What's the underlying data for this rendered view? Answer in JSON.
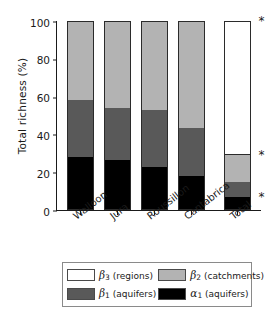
{
  "chart_data": {
    "type": "bar",
    "subtype": "stacked-bar-percent",
    "title": "",
    "xlabel": "",
    "ylabel": "Total richness (%)",
    "ylim": [
      0,
      100
    ],
    "yticks": [
      0,
      20,
      40,
      60,
      80,
      100
    ],
    "ytick_labels": [
      "0",
      "20",
      "40",
      "60",
      "80",
      "100"
    ],
    "grid": false,
    "legend_position": "bottom",
    "categories": [
      "Walloon",
      "Jura",
      "Roussillon",
      "Cantabrica",
      "Total"
    ],
    "series": [
      {
        "name": "alpha_1 (aquifers)",
        "key": "a1",
        "color": "#000000",
        "values": [
          28,
          26.5,
          23,
          18,
          7
        ]
      },
      {
        "name": "beta_1 (aquifers)",
        "key": "b1",
        "color": "#595959",
        "values": [
          30,
          27.5,
          30,
          25.5,
          8
        ]
      },
      {
        "name": "beta_2 (catchments)",
        "key": "b2",
        "color": "#b3b3b3",
        "values": [
          42,
          46,
          47,
          56.5,
          14
        ]
      },
      {
        "name": "beta_3 (regions)",
        "key": "b3",
        "color": "#ffffff",
        "values": [
          0,
          0,
          0,
          0,
          71
        ]
      }
    ],
    "cumulative_tops": {
      "Walloon": [
        28,
        58,
        100,
        100
      ],
      "Jura": [
        26.5,
        54,
        100,
        100
      ],
      "Roussillon": [
        23,
        53,
        100,
        100
      ],
      "Cantabrica": [
        18,
        43.5,
        100,
        100
      ],
      "Total": [
        7,
        15,
        29,
        100
      ]
    },
    "annotations": [
      {
        "text": "*",
        "category": "Total",
        "y": 100
      },
      {
        "text": "*",
        "category": "Total",
        "y": 29
      },
      {
        "text": "*",
        "category": "Total",
        "y": 7
      }
    ]
  },
  "legend": {
    "entries": [
      {
        "symbol": "β",
        "sub": "3",
        "label": "(regions)",
        "swatch": "#ffffff"
      },
      {
        "symbol": "β",
        "sub": "2",
        "label": "(catchments)",
        "swatch": "#b3b3b3"
      },
      {
        "symbol": "β",
        "sub": "1",
        "label": "(aquifers)",
        "swatch": "#595959"
      },
      {
        "symbol": "α",
        "sub": "1",
        "label": "(aquifers)",
        "swatch": "#000000"
      }
    ]
  },
  "colors": {
    "alpha1": "#000000",
    "beta1": "#595959",
    "beta2": "#b3b3b3",
    "beta3": "#ffffff",
    "axis": "#1a1a1a",
    "legend_border": "#8a8a8a"
  }
}
